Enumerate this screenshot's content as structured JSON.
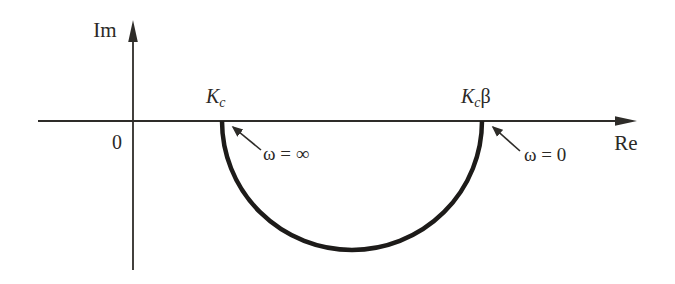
{
  "diagram": {
    "axis": {
      "im_label": "Im",
      "re_label": "Re",
      "origin_label": "0"
    },
    "points": {
      "kc": {
        "base": "K",
        "sub": "c"
      },
      "kc_beta": {
        "base": "K",
        "sub": "c",
        "suffix": "β"
      }
    },
    "annotations": {
      "omega_infinity": "ω = ∞",
      "omega_zero": "ω = 0"
    },
    "curve": {
      "shape": "semicircle",
      "plane": "lower-half",
      "start_point": "Kc at ω = ∞",
      "end_point": "Kcβ at ω = 0"
    },
    "colors": {
      "ink": "#2e2c29",
      "curve": "#1d1b19",
      "background": "#ffffff"
    }
  }
}
